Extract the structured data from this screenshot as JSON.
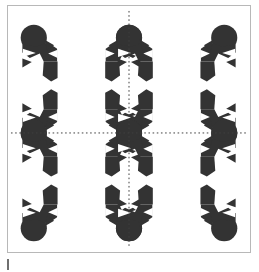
{
  "figure": {
    "caption_mark": "|",
    "frame": {
      "border_color": "#b8b8b8",
      "background_color": "#ffffff",
      "x": 7,
      "y": 5,
      "width": 244,
      "height": 248
    },
    "colors": {
      "ink": "#333333",
      "paper": "#ffffff",
      "axis_line": "#404040",
      "frame": "#b8b8b8",
      "tick_mark": "#6f6f6f"
    },
    "axes": {
      "vertical_line": {
        "label": "vertical-symmetry-axis",
        "style": "dotted",
        "x": 129,
        "from_y": 10,
        "to_y": 248,
        "color": "#404040",
        "dash": "1.6 2.6"
      },
      "horizontal_line": {
        "label": "horizontal-symmetry-axis",
        "style": "dotted",
        "y": 133,
        "from_x": 10,
        "to_x": 248,
        "color": "#404040",
        "dash": "1.6 2.6"
      }
    },
    "pattern": {
      "type": "tessellation",
      "description": "Four-fold mirror-symmetric motif of dark discs, triangular wedges and eight-pointed white stars",
      "motif_cols": 4,
      "motif_rows": 4,
      "cell_size": 48,
      "origin_x": 33,
      "origin_y": 37,
      "symmetry": "pmm (mirror about both dotted axes)",
      "disc_radius": 13,
      "star_points": 8
    }
  }
}
